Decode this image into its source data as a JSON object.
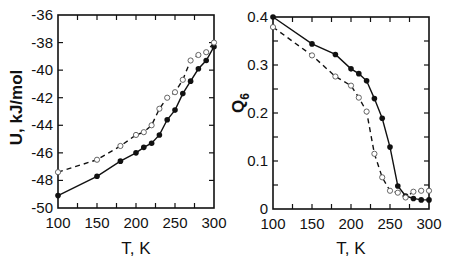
{
  "chart_data": [
    {
      "type": "line",
      "panel": "left",
      "title": "",
      "xlabel": "T, K",
      "ylabel": "U, kJ/mol",
      "xlim": [
        100,
        300
      ],
      "ylim": [
        -50,
        -36
      ],
      "xticks": [
        100,
        150,
        200,
        250,
        300
      ],
      "yticks": [
        -50,
        -48,
        -46,
        -44,
        -42,
        -40,
        -38,
        -36
      ],
      "x_minor_step": 25,
      "y_minor_step": 2,
      "grid": false,
      "legend": null,
      "series": [
        {
          "name": "filled",
          "marker": "filled-circle",
          "line": "solid",
          "x": [
            100,
            150,
            180,
            200,
            210,
            220,
            230,
            240,
            250,
            260,
            270,
            280,
            290,
            300
          ],
          "values": [
            -49.1,
            -47.7,
            -46.6,
            -46.0,
            -45.6,
            -45.3,
            -44.7,
            -43.6,
            -42.9,
            -41.7,
            -40.8,
            -39.9,
            -39.3,
            -38.3
          ]
        },
        {
          "name": "open",
          "marker": "open-circle",
          "line": "dashed",
          "x": [
            100,
            150,
            180,
            200,
            210,
            220,
            230,
            240,
            250,
            260,
            270,
            280,
            290,
            300
          ],
          "values": [
            -47.4,
            -46.5,
            -45.5,
            -44.7,
            -44.5,
            -44.0,
            -42.8,
            -42.0,
            -41.6,
            -40.7,
            -39.3,
            -38.9,
            -38.7,
            -38.0
          ]
        }
      ]
    },
    {
      "type": "line",
      "panel": "right",
      "title": "",
      "xlabel": "T, K",
      "ylabel": "Q6",
      "ylabel_main": "Q",
      "ylabel_sub": "6",
      "xlim": [
        100,
        300
      ],
      "ylim": [
        0,
        0.4
      ],
      "xticks": [
        100,
        150,
        200,
        250,
        300
      ],
      "yticks": [
        0,
        0.1,
        0.2,
        0.3,
        0.4
      ],
      "ytick_labels": [
        "0",
        "0.1",
        "0.2",
        "0.3",
        "0.4"
      ],
      "x_minor_step": 25,
      "y_minor_step": 0.05,
      "grid": false,
      "legend": null,
      "series": [
        {
          "name": "filled",
          "marker": "filled-circle",
          "line": "solid",
          "x": [
            100,
            150,
            180,
            200,
            210,
            220,
            230,
            240,
            250,
            260,
            270,
            280,
            290,
            300
          ],
          "values": [
            0.4,
            0.344,
            0.322,
            0.292,
            0.282,
            0.267,
            0.23,
            0.189,
            0.129,
            0.048,
            0.027,
            0.022,
            0.019,
            0.019
          ]
        },
        {
          "name": "open",
          "marker": "open-circle",
          "line": "dashed",
          "x": [
            100,
            150,
            180,
            200,
            210,
            220,
            230,
            240,
            250,
            260,
            270,
            280,
            290,
            300
          ],
          "values": [
            0.379,
            0.32,
            0.276,
            0.257,
            0.232,
            0.203,
            0.115,
            0.066,
            0.038,
            0.034,
            0.024,
            0.036,
            0.038,
            0.038
          ]
        }
      ]
    }
  ],
  "layout": {
    "panels": [
      {
        "frame": {
          "x0": 58,
          "y0": 15,
          "x1": 214,
          "y1": 208
        }
      },
      {
        "frame": {
          "x0": 273,
          "y0": 17,
          "x1": 429,
          "y1": 209
        }
      }
    ]
  },
  "labels": {
    "left_xlabel": "T, K",
    "left_ylabel": "U, kJ/mol",
    "right_xlabel": "T, K",
    "right_ylabel_main": "Q",
    "right_ylabel_sub": "6"
  }
}
